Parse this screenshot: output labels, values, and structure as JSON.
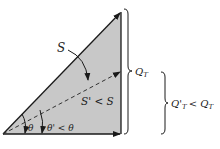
{
  "diagram": {
    "labels": {
      "apparent_power": "S",
      "reduced_apparent_power": "S' < S",
      "angle": "θ",
      "reduced_angle": "θ' < θ",
      "reactive_power": "Q",
      "reactive_power_sub": "T",
      "reduced_reactive_power_prefix": "Q'",
      "reduced_reactive_power_sub": "T",
      "reduced_reactive_power_rel": "< Q",
      "reduced_reactive_power_rel_sub": "T"
    },
    "colors": {
      "fill": "#c8c8c8",
      "stroke": "#1a1a1a",
      "background": "#ffffff"
    }
  }
}
